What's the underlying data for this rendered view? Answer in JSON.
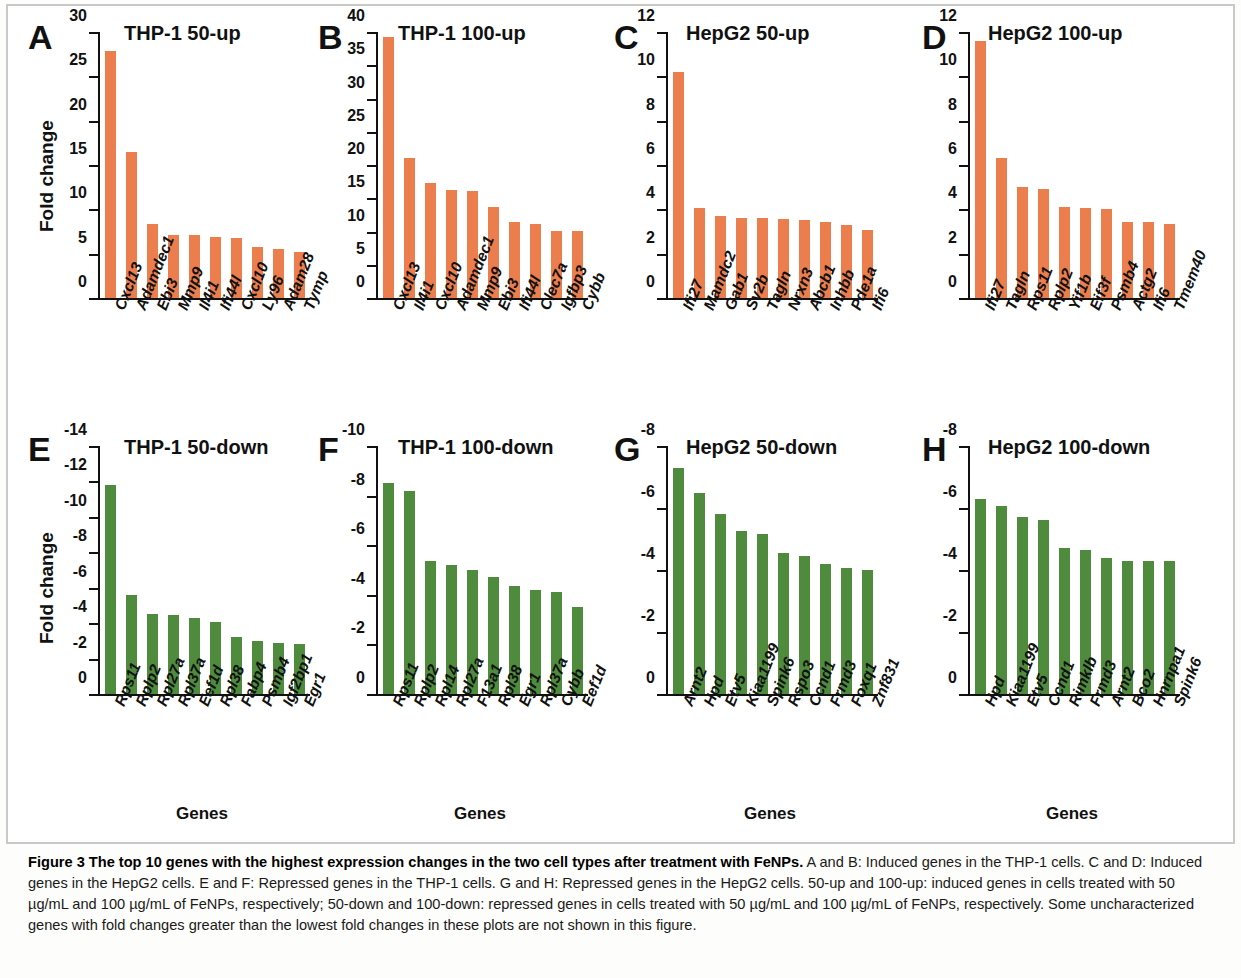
{
  "figure": {
    "caption_lead": "Figure 3 The top 10 genes with the highest expression changes in the two cell types after treatment with FeNPs.",
    "caption_rest": " A and B: Induced genes in the THP-1 cells. C and D: Induced genes in the HepG2 cells. E and F: Repressed genes in the THP-1 cells. G and H: Repressed genes in the HepG2 cells. 50-up and 100-up: induced genes in cells treated with 50 µg/mL and 100 µg/mL of FeNPs, respectively; 50-down and 100-down: repressed genes in cells treated with 50 µg/mL and 100 µg/mL of FeNPs, respectively. Some uncharacterized genes with fold changes greater than the lowest fold changes in these plots are not shown in this figure."
  },
  "colors": {
    "induced_bar": "#ec7d4c",
    "repressed_bar": "#4e8b3d",
    "axis": "#111111",
    "frame": "#c9c9c9"
  },
  "axis_titles": {
    "y": "Fold change",
    "x": "Genes"
  },
  "chart_data": [
    {
      "panel": "A",
      "type": "bar",
      "title": "THP-1  50-up",
      "ylabel": "Fold change",
      "xlabel": "",
      "ylim": [
        0,
        30
      ],
      "yticks": [
        0,
        5,
        10,
        15,
        20,
        25,
        30
      ],
      "grid": false,
      "legend": "none",
      "bar_color": "#ec7d4c",
      "categories": [
        "Cxcl13",
        "Adamdec1",
        "Ebi3",
        "Mmp9",
        "Il4i1",
        "Ifi44l",
        "Cxcl10",
        "Ly96",
        "Adam28",
        "Tymp"
      ],
      "values": [
        27.9,
        16.5,
        8.3,
        7.1,
        7.1,
        6.9,
        6.8,
        5.8,
        5.5,
        5.2
      ]
    },
    {
      "panel": "B",
      "type": "bar",
      "title": "THP-1  100-up",
      "ylabel": "",
      "xlabel": "",
      "ylim": [
        0,
        40
      ],
      "yticks": [
        0,
        5,
        10,
        15,
        20,
        25,
        30,
        35,
        40
      ],
      "grid": false,
      "legend": "none",
      "bar_color": "#ec7d4c",
      "categories": [
        "Cxcl13",
        "Il4i1",
        "Cxcl10",
        "Adamdec1",
        "Mmp9",
        "Ebi3",
        "Ifi44l",
        "Clec7a",
        "Igfbp3",
        "Cybb"
      ],
      "values": [
        39.2,
        21.1,
        17.3,
        16.2,
        16.1,
        13.7,
        11.4,
        11.2,
        10.1,
        10.1
      ]
    },
    {
      "panel": "C",
      "type": "bar",
      "title": "HepG2  50-up",
      "ylabel": "",
      "xlabel": "",
      "ylim": [
        0,
        12
      ],
      "yticks": [
        0,
        2,
        4,
        6,
        8,
        10,
        12
      ],
      "grid": false,
      "legend": "none",
      "bar_color": "#ec7d4c",
      "categories": [
        "Ifi27",
        "Mamdc2",
        "Gab1",
        "Sv2b",
        "Tagln",
        "Nrxn3",
        "Abcb1",
        "Inhbb",
        "Pde1a",
        "Ifi6"
      ],
      "values": [
        10.2,
        4.05,
        3.7,
        3.6,
        3.6,
        3.55,
        3.5,
        3.45,
        3.3,
        3.05
      ]
    },
    {
      "panel": "D",
      "type": "bar",
      "title": "HepG2  100-up",
      "ylabel": "",
      "xlabel": "",
      "ylim": [
        0,
        12
      ],
      "yticks": [
        0,
        2,
        4,
        6,
        8,
        10,
        12
      ],
      "grid": false,
      "legend": "none",
      "bar_color": "#ec7d4c",
      "categories": [
        "Ifi27",
        "Tagln",
        "Rps11",
        "Rplp2",
        "Yif1b",
        "Eif3f",
        "Psmb4",
        "Actg2",
        "Ifi6",
        "Tmem40"
      ],
      "values": [
        11.6,
        6.3,
        5.0,
        4.9,
        4.1,
        4.05,
        4.0,
        3.45,
        3.45,
        3.35
      ]
    },
    {
      "panel": "E",
      "type": "bar",
      "title": "THP-1  50-down",
      "ylabel": "Fold change",
      "xlabel": "Genes",
      "ylim": [
        0,
        -14
      ],
      "yticks": [
        0,
        -2,
        -4,
        -6,
        -8,
        -10,
        -12,
        -14
      ],
      "grid": false,
      "legend": "none",
      "bar_color": "#4e8b3d",
      "categories": [
        "Rps11",
        "Rplp2",
        "Rpl27a",
        "Rpl37a",
        "Eef1d",
        "Rpl38",
        "Fabp4",
        "Psmb4",
        "Igf2bp1",
        "Egr1"
      ],
      "values": [
        -11.8,
        -5.6,
        -4.5,
        -4.45,
        -4.3,
        -4.05,
        -3.2,
        -3.0,
        -2.9,
        -2.85
      ]
    },
    {
      "panel": "F",
      "type": "bar",
      "title": "THP-1  100-down",
      "ylabel": "",
      "xlabel": "Genes",
      "ylim": [
        0,
        -10
      ],
      "yticks": [
        0,
        -2,
        -4,
        -6,
        -8,
        -10
      ],
      "grid": false,
      "legend": "none",
      "bar_color": "#4e8b3d",
      "categories": [
        "Rps11",
        "Rplp2",
        "Rpl14",
        "Rpl27a",
        "F13a1",
        "Rpl38",
        "Egr1",
        "Rpl37a",
        "Cybb",
        "Eef1d"
      ],
      "values": [
        -8.5,
        -8.2,
        -5.35,
        -5.2,
        -5.0,
        -4.7,
        -4.35,
        -4.2,
        -4.1,
        -3.5
      ]
    },
    {
      "panel": "G",
      "type": "bar",
      "title": "HepG2  50-down",
      "ylabel": "",
      "xlabel": "Genes",
      "ylim": [
        0,
        -8
      ],
      "yticks": [
        0,
        -2,
        -4,
        -6,
        -8
      ],
      "grid": false,
      "legend": "none",
      "bar_color": "#4e8b3d",
      "categories": [
        "Arnt2",
        "Hpd",
        "Etv5",
        "Kiaa1199",
        "Spink6",
        "Rspo3",
        "Ccnd1",
        "Frmd3",
        "Foxq1",
        "Znf831"
      ],
      "values": [
        -7.3,
        -6.5,
        -5.8,
        -5.25,
        -5.15,
        -4.55,
        -4.45,
        -4.2,
        -4.05,
        -4.0
      ]
    },
    {
      "panel": "H",
      "type": "bar",
      "title": "HepG2  100-down",
      "ylabel": "",
      "xlabel": "Genes",
      "ylim": [
        0,
        -8
      ],
      "yticks": [
        0,
        -2,
        -4,
        -6,
        -8
      ],
      "grid": false,
      "legend": "none",
      "bar_color": "#4e8b3d",
      "categories": [
        "Hpd",
        "Kiaa1199",
        "Etv5",
        "Ccnd1",
        "Rimklb",
        "Frmd3",
        "Arnt2",
        "Bco2",
        "Hnrnpa1",
        "Spink6"
      ],
      "values": [
        -6.3,
        -6.05,
        -5.7,
        -5.6,
        -4.7,
        -4.65,
        -4.4,
        -4.3,
        -4.3,
        -4.3
      ]
    }
  ]
}
